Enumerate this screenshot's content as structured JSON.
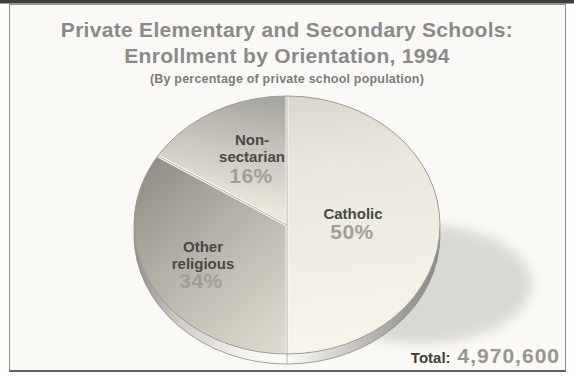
{
  "figure": {
    "title_line1": "Private Elementary and Secondary Schools:",
    "title_line2": "Enrollment by Orientation, 1994",
    "subtitle": "(By percentage of private school population)"
  },
  "chart_data": {
    "type": "pie",
    "title": "Private Elementary and Secondary Schools: Enrollment by Orientation, 1994",
    "subtitle": "(By percentage of private school population)",
    "unit": "percent of private school population",
    "direction": "clockwise",
    "start_angle": "12-o-clock",
    "legend_position": "labels-inside-slices",
    "slices": [
      {
        "label": "Catholic",
        "label_lines": [
          "Catholic"
        ],
        "pct_label": "50%",
        "value": 50,
        "fill_gradient": [
          [
            0,
            "#d9d7ce"
          ],
          [
            0.28,
            "#eae8dd"
          ],
          [
            1,
            "#f7f5ea"
          ]
        ]
      },
      {
        "label": "Other religious",
        "label_lines": [
          "Other",
          "religious"
        ],
        "pct_label": "34%",
        "value": 34,
        "fill_gradient": [
          [
            0,
            "#918d86"
          ],
          [
            0.5,
            "#b9b6ac"
          ],
          [
            1,
            "#dddacd"
          ]
        ]
      },
      {
        "label": "Non-sectarian",
        "label_lines": [
          "Non-",
          "sectarian"
        ],
        "pct_label": "16%",
        "value": 16,
        "fill_gradient": [
          [
            0,
            "#a7a5a0"
          ],
          [
            1,
            "#eae8db"
          ]
        ]
      }
    ],
    "rim_gradient": [
      [
        0,
        "#8f8d88"
      ],
      [
        0.15,
        "#cfcdc8"
      ],
      [
        0.35,
        "#f3f2ee"
      ],
      [
        0.5,
        "#fcfcf9"
      ],
      [
        0.65,
        "#d8d6d1"
      ],
      [
        0.85,
        "#a5a39e"
      ],
      [
        1,
        "#8a8883"
      ]
    ],
    "total": {
      "label": "Total:",
      "value": "4,970,600"
    }
  },
  "colors": {
    "page_top_band": "#3e3e3e",
    "frame_border": "#8f8f8f",
    "frame_bg": "#faf9f6",
    "title_text": "#8a8a8a",
    "subtitle_text": "#7c7c7c",
    "label_text": "#484844",
    "pct_text": "#a19f97",
    "total_label_text": "#3d3d3a",
    "total_value_text": "#98968e",
    "outline": "#9c9a95",
    "divider_hairline": "#a09e99",
    "divider_gap": "#faf9f5",
    "shadow": "#d7d6d2"
  }
}
